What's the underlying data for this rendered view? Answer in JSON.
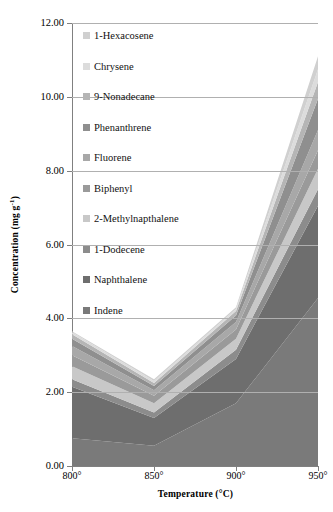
{
  "chart_data": {
    "type": "area",
    "stacked": true,
    "title": "",
    "xlabel": "Temperature (°C)",
    "ylabel": "Concentration (mg g⁻¹)",
    "categories": [
      "800°",
      "850°",
      "900°",
      "950°"
    ],
    "x_values": [
      800,
      850,
      900,
      950
    ],
    "ylim": [
      0.0,
      12.0
    ],
    "y_ticks": [
      "0.00",
      "2.00",
      "4.00",
      "6.00",
      "8.00",
      "10.00",
      "12.00"
    ],
    "y_tick_values": [
      0.0,
      2.0,
      4.0,
      6.0,
      8.0,
      10.0,
      12.0
    ],
    "grid": "horizontal",
    "legend_position": "inside-top-left",
    "stack_order_bottom_to_top": [
      "Indene",
      "Naphthalene",
      "1-Dodecene",
      "2-Methylnapthalene",
      "Biphenyl",
      "Fluorene",
      "Phenanthrene",
      "9-Nonadecane",
      "Chrysene",
      "1-Hexacosene"
    ],
    "series": [
      {
        "name": "Indene",
        "color": "#7a7a7a",
        "values": [
          0.75,
          0.55,
          1.7,
          4.55
        ]
      },
      {
        "name": "Naphthalene",
        "color": "#6e6e6e",
        "values": [
          1.4,
          0.75,
          1.2,
          2.5
        ]
      },
      {
        "name": "1-Dodecene",
        "color": "#8c8c8c",
        "values": [
          0.2,
          0.15,
          0.25,
          0.45
        ]
      },
      {
        "name": "2-Methylnapthalene",
        "color": "#c8c8c8",
        "values": [
          0.35,
          0.25,
          0.3,
          0.55
        ]
      },
      {
        "name": "Biphenyl",
        "color": "#9a9a9a",
        "values": [
          0.3,
          0.2,
          0.25,
          0.5
        ]
      },
      {
        "name": "Fluorene",
        "color": "#a8a8a8",
        "values": [
          0.25,
          0.15,
          0.2,
          0.55
        ]
      },
      {
        "name": "Phenanthrene",
        "color": "#8f8f8f",
        "values": [
          0.2,
          0.12,
          0.18,
          0.85
        ]
      },
      {
        "name": "9-Nonadecane",
        "color": "#b5b5b5",
        "values": [
          0.12,
          0.08,
          0.12,
          0.45
        ]
      },
      {
        "name": "Chrysene",
        "color": "#dcdcdc",
        "values": [
          0.05,
          0.05,
          0.05,
          0.35
        ]
      },
      {
        "name": "1-Hexacosene",
        "color": "#d0d0d0",
        "values": [
          0.03,
          0.05,
          0.05,
          0.35
        ]
      }
    ],
    "legend_entries": [
      {
        "label": "1-Hexacosene",
        "color": "#d0d0d0"
      },
      {
        "label": "Chrysene",
        "color": "#dcdcdc"
      },
      {
        "label": "9-Nonadecane",
        "color": "#b5b5b5"
      },
      {
        "label": "Phenanthrene",
        "color": "#8f8f8f"
      },
      {
        "label": "Fluorene",
        "color": "#a8a8a8"
      },
      {
        "label": "Biphenyl",
        "color": "#9a9a9a"
      },
      {
        "label": "2-Methylnapthalene",
        "color": "#c8c8c8"
      },
      {
        "label": "1-Dodecene",
        "color": "#8c8c8c"
      },
      {
        "label": "Naphthalene",
        "color": "#6e6e6e"
      },
      {
        "label": "Indene",
        "color": "#7a7a7a"
      }
    ],
    "totals": [
      3.65,
      2.35,
      4.3,
      11.1
    ],
    "colors": {
      "axis": "#808080",
      "grid": "#b0b0b0",
      "text": "#000000",
      "background": "#ffffff"
    }
  },
  "axes": {
    "y_title_main": "Concentration (mg g",
    "y_title_sup": "-1",
    "y_title_tail": ")",
    "x_title": "Temperature (°C)"
  }
}
